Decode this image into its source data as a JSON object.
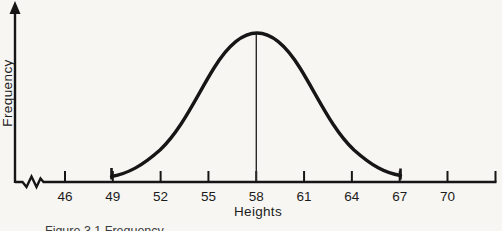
{
  "chart_data": {
    "type": "line",
    "title": "",
    "xlabel": "Heights",
    "ylabel": "Frequency",
    "x_ticks": [
      46,
      49,
      52,
      55,
      58,
      61,
      64,
      67,
      70
    ],
    "x_axis_range_shown": [
      44.5,
      73
    ],
    "unlabeled_end_tick": true,
    "axis_break_near_origin": true,
    "y_axis_arrow": true,
    "mean_line_x": 58,
    "curve_start_x": 49,
    "curve_end_x": 67,
    "series": [
      {
        "name": "frequency-curve",
        "x": [
          49,
          52,
          55,
          58,
          61,
          64,
          67
        ],
        "y_relative": [
          0.04,
          0.21,
          0.66,
          1.0,
          0.66,
          0.21,
          0.04
        ]
      }
    ],
    "grid": false,
    "legend": "none"
  },
  "labels": {
    "ylabel": "Frequency",
    "xlabel": "Heights",
    "caption_partial": "Figure 3.1 Frequency"
  },
  "colors": {
    "background": "#f7f6f3",
    "line": "#161616",
    "text": "#1c1c1c"
  }
}
